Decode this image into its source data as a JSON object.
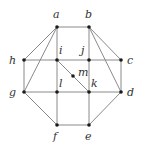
{
  "diagram": {
    "type": "graph",
    "nodes": [
      {
        "id": "a",
        "label": "a",
        "x": 57,
        "y": 27,
        "lx": 53,
        "ly": 18
      },
      {
        "id": "b",
        "label": "b",
        "x": 89,
        "y": 27,
        "lx": 85,
        "ly": 18
      },
      {
        "id": "h",
        "label": "h",
        "x": 24,
        "y": 60,
        "lx": 9,
        "ly": 64
      },
      {
        "id": "i",
        "label": "i",
        "x": 57,
        "y": 60,
        "lx": 59,
        "ly": 54
      },
      {
        "id": "j",
        "label": "j",
        "x": 89,
        "y": 60,
        "lx": 81,
        "ly": 54
      },
      {
        "id": "c",
        "label": "c",
        "x": 121,
        "y": 60,
        "lx": 127,
        "ly": 64
      },
      {
        "id": "m",
        "label": "m",
        "x": 73,
        "y": 76,
        "lx": 78,
        "ly": 76
      },
      {
        "id": "g",
        "label": "g",
        "x": 24,
        "y": 92,
        "lx": 9,
        "ly": 96
      },
      {
        "id": "l",
        "label": "l",
        "x": 57,
        "y": 92,
        "lx": 59,
        "ly": 87
      },
      {
        "id": "k",
        "label": "k",
        "x": 89,
        "y": 92,
        "lx": 91,
        "ly": 87
      },
      {
        "id": "d",
        "label": "d",
        "x": 121,
        "y": 92,
        "lx": 127,
        "ly": 96
      },
      {
        "id": "f",
        "label": "f",
        "x": 57,
        "y": 125,
        "lx": 53,
        "ly": 140
      },
      {
        "id": "e",
        "label": "e",
        "x": 89,
        "y": 125,
        "lx": 85,
        "ly": 140
      }
    ],
    "edges": [
      [
        "a",
        "b"
      ],
      [
        "a",
        "h"
      ],
      [
        "a",
        "g"
      ],
      [
        "a",
        "i"
      ],
      [
        "b",
        "j"
      ],
      [
        "b",
        "c"
      ],
      [
        "b",
        "d"
      ],
      [
        "h",
        "i"
      ],
      [
        "i",
        "j"
      ],
      [
        "j",
        "c"
      ],
      [
        "h",
        "g"
      ],
      [
        "c",
        "d"
      ],
      [
        "i",
        "l"
      ],
      [
        "i",
        "m"
      ],
      [
        "m",
        "k"
      ],
      [
        "j",
        "k"
      ],
      [
        "g",
        "l"
      ],
      [
        "l",
        "k"
      ],
      [
        "k",
        "d"
      ],
      [
        "g",
        "f"
      ],
      [
        "l",
        "f"
      ],
      [
        "k",
        "e"
      ],
      [
        "d",
        "e"
      ],
      [
        "f",
        "e"
      ]
    ]
  }
}
